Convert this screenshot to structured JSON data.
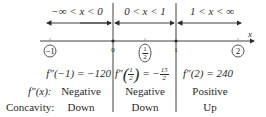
{
  "intervals": [
    {
      "label": "−∞ < x < 0"
    },
    {
      "label": "0 < x < 1"
    },
    {
      "label": "1 < x < ∞"
    }
  ],
  "axis": {
    "label": "x",
    "ticks": [
      "0",
      "1"
    ],
    "test_points": [
      {
        "label": "−1"
      },
      {
        "num": "1",
        "den": "2"
      },
      {
        "label": "2"
      }
    ]
  },
  "rows": {
    "evaluations": [
      {
        "func": "f″(−1) = −120"
      },
      {
        "func": "f″",
        "num": "1",
        "den": "2",
        "eq": "= −",
        "rnum": "15",
        "rden": "2"
      },
      {
        "func": "f″(2) = 240"
      }
    ],
    "sign_label": "f″(x):",
    "signs": [
      "Negative",
      "Negative",
      "Positive"
    ],
    "concavity_label": "Concavity:",
    "concavity": [
      "Down",
      "Down",
      "Up"
    ]
  },
  "colors": {
    "ink": "#2a2a2a"
  }
}
